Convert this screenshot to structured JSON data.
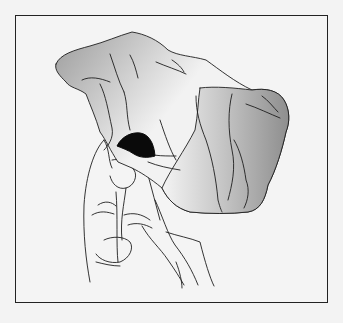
{
  "illustration": {
    "subject": "hand holding crumpled cloth with dark object emerging",
    "alt": "Line drawing of a hand gripping a crumpled handkerchief; a black rounded object peeks out between the fingers and the cloth",
    "colors": {
      "background": "#f3f3f3",
      "frame": "#222222",
      "line": "#1e1e1e",
      "object": "#0a0a0a",
      "cloth_shade_dark": "#9a9a9a",
      "cloth_shade_light": "#f4f4f4"
    }
  }
}
